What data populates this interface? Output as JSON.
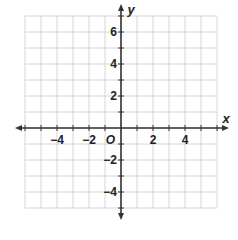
{
  "chart_data": {
    "type": "coordinate-plane",
    "title": "",
    "xlabel": "x",
    "ylabel": "y",
    "xlim": [
      -6,
      6
    ],
    "ylim": [
      -5,
      7
    ],
    "grid": true,
    "grid_step": 1,
    "origin_label": "O",
    "x_tick_labels": [
      {
        "value": -4,
        "label": "−4"
      },
      {
        "value": -2,
        "label": "−2"
      },
      {
        "value": 2,
        "label": "2"
      },
      {
        "value": 4,
        "label": "4"
      }
    ],
    "y_tick_labels": [
      {
        "value": 6,
        "label": "6"
      },
      {
        "value": 4,
        "label": "4"
      },
      {
        "value": 2,
        "label": "2"
      },
      {
        "value": -2,
        "label": "−2"
      },
      {
        "value": -4,
        "label": "−4"
      }
    ],
    "colors": {
      "grid": "#d6d6d6",
      "axis": "#333333",
      "text": "#222222"
    }
  }
}
